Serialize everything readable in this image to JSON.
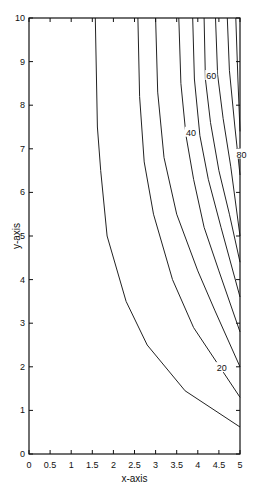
{
  "chart_data": {
    "type": "contour",
    "title": "",
    "xlabel": "x-axis",
    "ylabel": "y-axis",
    "xlim": [
      0,
      5
    ],
    "ylim": [
      0,
      10
    ],
    "grid": false,
    "x_ticks": [
      "0",
      "0.5",
      "1",
      "1.5",
      "2",
      "2.5",
      "3",
      "3.5",
      "4",
      "4.5",
      "5"
    ],
    "y_ticks": [
      "0",
      "1",
      "2",
      "3",
      "4",
      "5",
      "6",
      "7",
      "8",
      "9",
      "10"
    ],
    "contour_labels": [
      {
        "text": "20",
        "x": 4.45,
        "y": 1.9
      },
      {
        "text": "40",
        "x": 3.72,
        "y": 7.3
      },
      {
        "text": "60",
        "x": 4.2,
        "y": 8.6
      },
      {
        "text": "80",
        "x": 4.92,
        "y": 6.8
      }
    ],
    "contours": [
      {
        "level": 10,
        "points": [
          [
            1.57,
            10
          ],
          [
            1.62,
            7.5
          ],
          [
            1.7,
            6.5
          ],
          [
            1.85,
            5.0
          ],
          [
            2.3,
            3.5
          ],
          [
            2.8,
            2.5
          ],
          [
            3.7,
            1.45
          ],
          [
            5,
            0.62
          ]
        ]
      },
      {
        "level": 20,
        "points": [
          [
            2.58,
            10
          ],
          [
            2.62,
            8.2
          ],
          [
            2.73,
            6.7
          ],
          [
            2.95,
            5.5
          ],
          [
            3.4,
            4.0
          ],
          [
            3.9,
            2.9
          ],
          [
            5,
            1.3
          ]
        ]
      },
      {
        "level": 30,
        "points": [
          [
            3.0,
            10
          ],
          [
            3.05,
            8.3
          ],
          [
            3.2,
            6.8
          ],
          [
            3.5,
            5.5
          ],
          [
            4.0,
            4.2
          ],
          [
            4.4,
            3.3
          ],
          [
            5,
            2.0
          ]
        ]
      },
      {
        "level": 40,
        "points": [
          [
            3.55,
            10
          ],
          [
            3.6,
            8.5
          ],
          [
            3.72,
            7.3
          ],
          [
            3.9,
            6.3
          ],
          [
            4.15,
            5.2
          ],
          [
            4.5,
            4.2
          ],
          [
            5,
            2.8
          ]
        ]
      },
      {
        "level": 50,
        "points": [
          [
            3.88,
            10
          ],
          [
            3.92,
            8.6
          ],
          [
            4.05,
            7.3
          ],
          [
            4.25,
            6.3
          ],
          [
            4.55,
            5.2
          ],
          [
            5,
            3.6
          ]
        ]
      },
      {
        "level": 60,
        "points": [
          [
            4.15,
            10
          ],
          [
            4.18,
            8.6
          ],
          [
            4.3,
            7.6
          ],
          [
            4.5,
            6.5
          ],
          [
            4.75,
            5.5
          ],
          [
            5,
            4.4
          ]
        ]
      },
      {
        "level": 70,
        "points": [
          [
            4.42,
            10
          ],
          [
            4.47,
            8.7
          ],
          [
            4.6,
            7.7
          ],
          [
            4.78,
            6.6
          ],
          [
            5,
            5.0
          ]
        ]
      },
      {
        "level": 80,
        "points": [
          [
            4.7,
            10
          ],
          [
            4.75,
            8.8
          ],
          [
            4.88,
            7.5
          ],
          [
            5,
            6.4
          ]
        ]
      },
      {
        "level": 90,
        "points": [
          [
            4.9,
            10
          ],
          [
            4.95,
            8.6
          ],
          [
            5,
            7.4
          ]
        ]
      }
    ]
  }
}
